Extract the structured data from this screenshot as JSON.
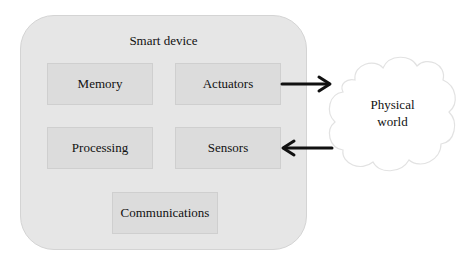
{
  "diagram": {
    "container": {
      "label": "Smart device"
    },
    "components": [
      {
        "id": "memory",
        "label": "Memory"
      },
      {
        "id": "actuators",
        "label": "Actuators"
      },
      {
        "id": "processing",
        "label": "Processing"
      },
      {
        "id": "sensors",
        "label": "Sensors"
      },
      {
        "id": "communications",
        "label": "Communications"
      }
    ],
    "external": {
      "label_line1": "Physical",
      "label_line2": "world"
    },
    "edges": [
      {
        "from": "actuators",
        "to": "physical-world"
      },
      {
        "from": "physical-world",
        "to": "sensors"
      }
    ]
  }
}
